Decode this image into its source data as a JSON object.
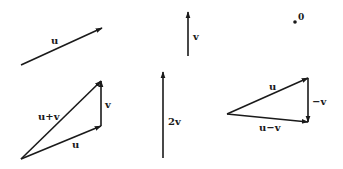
{
  "diagram": {
    "title": "",
    "colors": {
      "ink": "#1a1a1a",
      "background": "#ffffff"
    },
    "panels": [
      {
        "id": "u",
        "label": "u",
        "vectors": [
          {
            "name": "u",
            "from": [
              21,
              65
            ],
            "to": [
              102,
              28
            ]
          }
        ]
      },
      {
        "id": "v",
        "label": "v",
        "vectors": [
          {
            "name": "v",
            "from": [
              188,
              56
            ],
            "to": [
              188,
              12
            ]
          }
        ]
      },
      {
        "id": "origin",
        "label": "0",
        "point": [
          295,
          22
        ]
      },
      {
        "id": "sum",
        "labels": [
          "u+v",
          "v",
          "u"
        ],
        "vectors": [
          {
            "name": "u",
            "from": [
              21,
              159
            ],
            "to": [
              101,
              126
            ]
          },
          {
            "name": "v",
            "from": [
              101,
              126
            ],
            "to": [
              101,
              81
            ]
          },
          {
            "name": "u+v",
            "from": [
              21,
              159
            ],
            "to": [
              101,
              81
            ]
          }
        ]
      },
      {
        "id": "two-v",
        "label": "2v",
        "vectors": [
          {
            "name": "2v",
            "from": [
              163,
              158
            ],
            "to": [
              163,
              72
            ]
          }
        ]
      },
      {
        "id": "difference",
        "labels": [
          "u",
          "-v",
          "u-v"
        ],
        "vectors": [
          {
            "name": "u",
            "from": [
              227,
              114
            ],
            "to": [
              308,
              78
            ]
          },
          {
            "name": "-v",
            "from": [
              308,
              78
            ],
            "to": [
              308,
              122
            ]
          },
          {
            "name": "u-v",
            "from": [
              227,
              114
            ],
            "to": [
              308,
              122
            ]
          }
        ]
      }
    ]
  },
  "labels": {
    "u_top": "u",
    "v_top": "v",
    "origin": "0",
    "sum_uv": "u+v",
    "sum_v": "v",
    "sum_u": "u",
    "two_v": "2v",
    "diff_u": "u",
    "diff_neg_v": "−v",
    "diff_u_minus_v": "u−v"
  }
}
